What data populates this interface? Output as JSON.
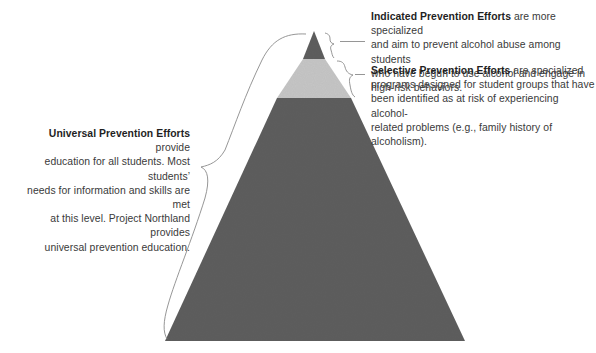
{
  "diagram": {
    "type": "pyramid",
    "colors": {
      "dark_tier": "#5e5e5e",
      "light_tier": "#c6c6c6",
      "brace_stroke": "#8a8a8a",
      "text": "#3a3a3a",
      "bold_text": "#1f1f1f"
    },
    "tiers": [
      {
        "name": "Indicated Prevention Efforts",
        "position": "top",
        "fill": "dark"
      },
      {
        "name": "Selective Prevention Efforts",
        "position": "middle",
        "fill": "light"
      },
      {
        "name": "Universal Prevention Efforts",
        "position": "bottom",
        "fill": "dark"
      }
    ]
  },
  "annotations": {
    "indicated": {
      "title": "Indicated Prevention Efforts",
      "lines": [
        " are more specialized",
        "and aim to prevent alcohol abuse among students",
        "who have begun to use alcohol and engage in",
        "high-risk behaviors."
      ]
    },
    "selective": {
      "title": "Selective Prevention Efforts",
      "lines": [
        " are specialized",
        "programs designed for student groups that have",
        "been identified as at risk of experiencing alcohol-",
        "related problems (e.g., family history of alcoholism)."
      ]
    },
    "universal": {
      "title": "Universal Prevention Efforts",
      "lines": [
        " provide",
        "education for all students. Most students’",
        "needs for information and skills are met",
        "at this level. Project Northland provides",
        "universal prevention education."
      ]
    }
  }
}
